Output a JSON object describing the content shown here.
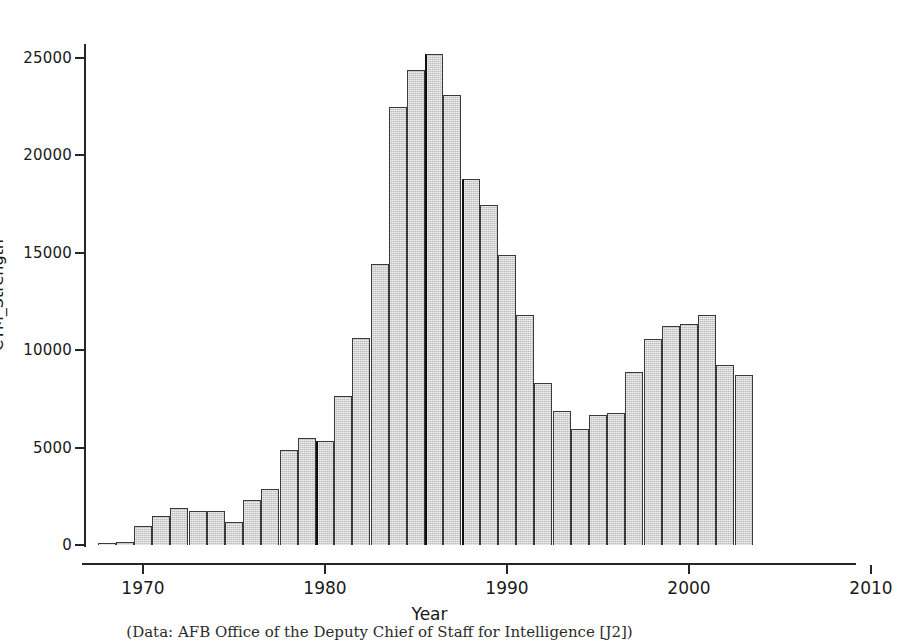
{
  "figure": {
    "caption": "(Data: AFB Office of the Deputy Chief of Staff for Intelligence [J2])"
  },
  "axes": {
    "x_title": "Year",
    "y_title": "CTM_Strength",
    "x_ticks": [
      "1970",
      "1980",
      "1990",
      "2000",
      "2010"
    ],
    "y_ticks": [
      "0",
      "5000",
      "10000",
      "15000",
      "20000",
      "25000"
    ]
  },
  "style": {
    "bar_fill": "#bdbdbd",
    "bar_edge": "#3a3a3a",
    "axis_color": "#262626",
    "background": "#ffffff"
  },
  "chart_data": {
    "type": "bar",
    "title": "",
    "xlabel": "Year",
    "ylabel": "CTM_Strength",
    "xlim": [
      1967,
      2011
    ],
    "ylim": [
      0,
      26500
    ],
    "grid": false,
    "legend": null,
    "bar_width_years": 1,
    "categories": [
      1968,
      1969,
      1970,
      1971,
      1972,
      1973,
      1974,
      1975,
      1976,
      1977,
      1978,
      1979,
      1980,
      1981,
      1982,
      1983,
      1984,
      1985,
      1986,
      1987,
      1988,
      1989,
      1990,
      1991,
      1992,
      1993,
      1994,
      1995,
      1996,
      1997,
      1998,
      1999,
      2000,
      2001,
      2002,
      2003
    ],
    "values": [
      100,
      150,
      1000,
      1500,
      1900,
      1750,
      1750,
      1200,
      2300,
      2850,
      4900,
      5500,
      5350,
      7650,
      10650,
      14400,
      22500,
      24400,
      25200,
      23100,
      18800,
      17450,
      14900,
      11800,
      8300,
      6900,
      5950,
      6650,
      6800,
      8900,
      10550,
      11250,
      11350,
      11800,
      9250,
      8750
    ]
  }
}
